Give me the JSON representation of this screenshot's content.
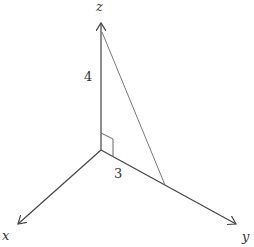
{
  "diagram": {
    "axes": {
      "x": {
        "label": "x"
      },
      "y": {
        "label": "y"
      },
      "z": {
        "label": "z"
      }
    },
    "measurements": {
      "vertical_leg": "4",
      "horizontal_leg": "3"
    },
    "right_angle_marker": true,
    "colors": {
      "axis": "#444444",
      "hypotenuse": "#777777",
      "text": "#333333"
    }
  }
}
